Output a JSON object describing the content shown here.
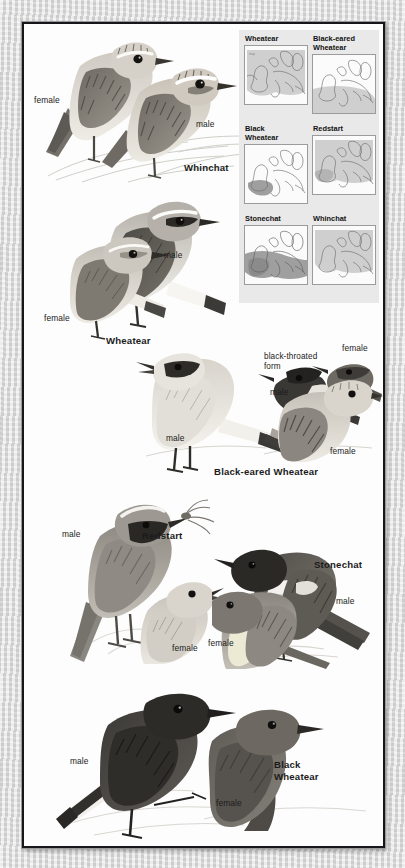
{
  "plate": {
    "title": "Chats and Wheatears field guide plate",
    "background_color": "#fdfdfd",
    "border_color": "#16171a",
    "margin_color": "#dcdcdc"
  },
  "sections": [
    {
      "id": "whinchat",
      "species_label": "Whinchat",
      "labels": [
        {
          "name": "female",
          "text": "female"
        },
        {
          "name": "male",
          "text": "male"
        }
      ]
    },
    {
      "id": "wheatear",
      "species_label": "Wheatear",
      "labels": [
        {
          "name": "male",
          "text": "male"
        },
        {
          "name": "female",
          "text": "female"
        }
      ]
    },
    {
      "id": "black-eared-wheatear",
      "species_label": "Black-eared Wheatear",
      "labels": [
        {
          "name": "male-left",
          "text": "male"
        },
        {
          "name": "form-note",
          "text": "black-throated\nform"
        },
        {
          "name": "male-form",
          "text": "male"
        },
        {
          "name": "female-top",
          "text": "female"
        },
        {
          "name": "female-right",
          "text": "female"
        }
      ]
    },
    {
      "id": "redstart",
      "species_label": "Redstart",
      "labels": [
        {
          "name": "male",
          "text": "male"
        },
        {
          "name": "female",
          "text": "female"
        }
      ]
    },
    {
      "id": "stonechat",
      "species_label": "Stonechat",
      "labels": [
        {
          "name": "male",
          "text": "male"
        },
        {
          "name": "female",
          "text": "female"
        }
      ]
    },
    {
      "id": "black-wheatear",
      "species_label": "Black\nWheatear",
      "labels": [
        {
          "name": "male",
          "text": "male"
        },
        {
          "name": "female",
          "text": "female"
        }
      ]
    }
  ],
  "maps": {
    "panel_background": "#e9e9e9",
    "range_fill_light": "#cfcfcf",
    "range_fill_dark": "#9f9f9f",
    "coast_color": "#6e6e6e",
    "cells": [
      {
        "id": "map-wheatear",
        "title": "Wheatear",
        "range": "most-of-europe"
      },
      {
        "id": "map-black-eared-wheatear",
        "title": "Black-eared\nWheatear",
        "range": "southern-europe"
      },
      {
        "id": "map-black-wheatear",
        "title": "Black\nWheatear",
        "range": "iberia"
      },
      {
        "id": "map-redstart",
        "title": "Redstart",
        "range": "most-of-europe"
      },
      {
        "id": "map-stonechat",
        "title": "Stonechat",
        "range": "west-and-south-europe"
      },
      {
        "id": "map-whinchat",
        "title": "Whinchat",
        "range": "most-of-europe"
      }
    ]
  }
}
